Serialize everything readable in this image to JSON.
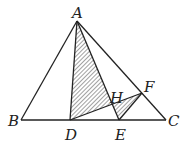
{
  "diagram": {
    "type": "geometry",
    "stroke_color": "#222222",
    "hatch_color": "#444444",
    "points": {
      "A": {
        "label": "A",
        "x": 77,
        "y": 21,
        "lx": 72,
        "ly": 18
      },
      "B": {
        "label": "B",
        "x": 21,
        "y": 120,
        "lx": 8,
        "ly": 126
      },
      "C": {
        "label": "C",
        "x": 166,
        "y": 120,
        "lx": 168,
        "ly": 126
      },
      "D": {
        "label": "D",
        "x": 70,
        "y": 120,
        "lx": 65,
        "ly": 140
      },
      "E": {
        "label": "E",
        "x": 119,
        "y": 120,
        "lx": 115,
        "ly": 140
      },
      "F": {
        "label": "F",
        "x": 142,
        "y": 93,
        "lx": 144,
        "ly": 92
      },
      "H": {
        "label": "H",
        "x": 112,
        "y": 104,
        "lx": 110,
        "ly": 103
      }
    },
    "segments": [
      [
        "A",
        "B"
      ],
      [
        "A",
        "C"
      ],
      [
        "B",
        "C"
      ],
      [
        "A",
        "D"
      ],
      [
        "A",
        "E"
      ],
      [
        "D",
        "F"
      ],
      [
        "E",
        "F"
      ]
    ],
    "shaded_regions": [
      [
        "A",
        "D",
        "H"
      ],
      [
        "H",
        "E",
        "F"
      ]
    ]
  }
}
